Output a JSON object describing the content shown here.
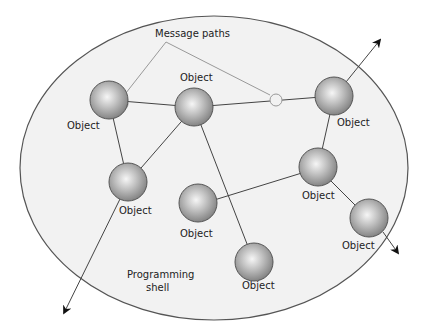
{
  "diagram": {
    "title_label": "Message paths",
    "shell_label_line1": "Programming",
    "shell_label_line2": "shell",
    "object_label": "Object",
    "colors": {
      "background": "#ffffff",
      "shell_fill": "#f2f2f2",
      "shell_stroke": "#555555",
      "sphere_light": "#f4f4f4",
      "sphere_mid": "#b8b8b8",
      "sphere_dark": "#7a7a7a",
      "connector": "#444444",
      "message_path": "#999999"
    },
    "objects": [
      {
        "id": "A",
        "label": "Object"
      },
      {
        "id": "B",
        "label": "Object"
      },
      {
        "id": "C",
        "label": "Object"
      },
      {
        "id": "D",
        "label": "Object"
      },
      {
        "id": "E",
        "label": "Object"
      },
      {
        "id": "F",
        "label": "Object"
      },
      {
        "id": "G",
        "label": "Object"
      },
      {
        "id": "H",
        "label": "Object"
      }
    ],
    "connections": [
      [
        "A",
        "B"
      ],
      [
        "B",
        "C"
      ],
      [
        "A",
        "D"
      ],
      [
        "B",
        "D"
      ],
      [
        "B",
        "H"
      ],
      [
        "C",
        "E"
      ],
      [
        "E",
        "F"
      ],
      [
        "E",
        "G"
      ]
    ],
    "external_arrows": [
      {
        "from": "C",
        "direction": "outgoing"
      },
      {
        "to": "G",
        "direction": "incoming"
      },
      {
        "to": "D",
        "direction": "incoming"
      }
    ]
  }
}
